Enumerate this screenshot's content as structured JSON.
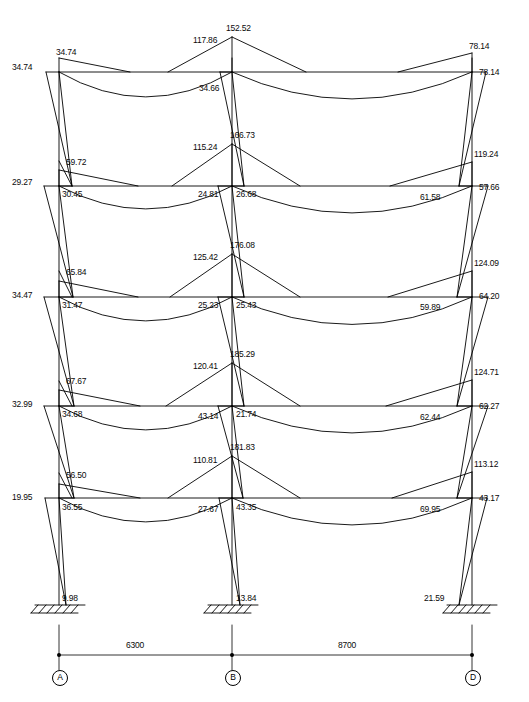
{
  "figure": {
    "type": "structural-bending-moment-diagram",
    "units_note": "kN·m",
    "ink_color": "#000000",
    "background_color": "#ffffff"
  },
  "geometry": {
    "columns": [
      {
        "id": "A",
        "x": 59
      },
      {
        "id": "B",
        "x": 232
      },
      {
        "id": "D",
        "x": 472
      }
    ],
    "floor_levels_y": [
      72,
      186,
      297,
      406,
      498
    ],
    "base_y": 605
  },
  "grid": {
    "labels": [
      "A",
      "B",
      "D"
    ],
    "x_positions": [
      59,
      232,
      472
    ]
  },
  "dimensions": {
    "line_y": 655,
    "spans": [
      {
        "label": "6300",
        "from": "A",
        "to": "B",
        "x": 126,
        "y": 641
      },
      {
        "label": "8700",
        "from": "B",
        "to": "D",
        "x": 338,
        "y": 641
      }
    ]
  },
  "supports": [
    {
      "at": "A",
      "label": "9.98",
      "x": 62,
      "y": 594
    },
    {
      "at": "B",
      "label": "13.84",
      "x": 236,
      "y": 594
    },
    {
      "at": "D",
      "label": "21.59",
      "x": 424,
      "y": 594
    }
  ],
  "storeys": [
    {
      "name": "storey-5-roof",
      "beam_y": 72,
      "labels": [
        {
          "value": "34.74",
          "x": 56,
          "y": 48,
          "anchor": "beam-left-top-A",
          "align": "left"
        },
        {
          "value": "34.74",
          "x": 12,
          "y": 63,
          "anchor": "column-top-A-left",
          "align": "left"
        },
        {
          "value": "117.86",
          "x": 193,
          "y": 36,
          "anchor": "beam-AB-right-end",
          "align": "left"
        },
        {
          "value": "152.52",
          "x": 226,
          "y": 24,
          "anchor": "column-top-B",
          "align": "left"
        },
        {
          "value": "34.66",
          "x": 199,
          "y": 84,
          "anchor": "column-B-top-below",
          "align": "left"
        },
        {
          "value": "78.14",
          "x": 469,
          "y": 42,
          "anchor": "beam-BD-right-end",
          "align": "left"
        },
        {
          "value": "78.14",
          "x": 479,
          "y": 68,
          "anchor": "column-top-D-right",
          "align": "left"
        }
      ]
    },
    {
      "name": "storey-4",
      "beam_y": 186,
      "labels": [
        {
          "value": "59.72",
          "x": 66,
          "y": 158,
          "anchor": "column-A-upper",
          "align": "left"
        },
        {
          "value": "29.27",
          "x": 12,
          "y": 178,
          "anchor": "joint-A-left",
          "align": "left"
        },
        {
          "value": "30.45",
          "x": 62,
          "y": 190,
          "anchor": "beam-AB-left-end",
          "align": "left"
        },
        {
          "value": "115.24",
          "x": 193,
          "y": 143,
          "anchor": "beam-AB-right-peak",
          "align": "left"
        },
        {
          "value": "166.73",
          "x": 230,
          "y": 131,
          "anchor": "joint-B",
          "align": "left"
        },
        {
          "value": "24.81",
          "x": 198,
          "y": 190,
          "anchor": "beam-AB-right-end",
          "align": "left"
        },
        {
          "value": "26.68",
          "x": 236,
          "y": 190,
          "anchor": "beam-BD-left-end",
          "align": "left"
        },
        {
          "value": "119.24",
          "x": 474,
          "y": 150,
          "anchor": "column-D-upper",
          "align": "left"
        },
        {
          "value": "61.58",
          "x": 420,
          "y": 193,
          "anchor": "beam-BD-right-end",
          "align": "left"
        },
        {
          "value": "57.66",
          "x": 479,
          "y": 183,
          "anchor": "joint-D-right",
          "align": "left"
        }
      ]
    },
    {
      "name": "storey-3",
      "beam_y": 297,
      "labels": [
        {
          "value": "65.84",
          "x": 66,
          "y": 268,
          "anchor": "column-A-upper",
          "align": "left"
        },
        {
          "value": "34.47",
          "x": 12,
          "y": 291,
          "anchor": "joint-A-left",
          "align": "left"
        },
        {
          "value": "31.47",
          "x": 62,
          "y": 301,
          "anchor": "beam-AB-left-end",
          "align": "left"
        },
        {
          "value": "125.42",
          "x": 193,
          "y": 253,
          "anchor": "beam-AB-right-peak",
          "align": "left"
        },
        {
          "value": "176.08",
          "x": 230,
          "y": 241,
          "anchor": "joint-B",
          "align": "left"
        },
        {
          "value": "25.23",
          "x": 198,
          "y": 301,
          "anchor": "beam-AB-right-end",
          "align": "left"
        },
        {
          "value": "25.43",
          "x": 236,
          "y": 301,
          "anchor": "beam-BD-left-end",
          "align": "left"
        },
        {
          "value": "124.09",
          "x": 474,
          "y": 259,
          "anchor": "column-D-upper",
          "align": "left"
        },
        {
          "value": "59.89",
          "x": 420,
          "y": 303,
          "anchor": "beam-BD-right-end",
          "align": "left"
        },
        {
          "value": "64.20",
          "x": 479,
          "y": 292,
          "anchor": "joint-D-right",
          "align": "left"
        }
      ]
    },
    {
      "name": "storey-2",
      "beam_y": 406,
      "labels": [
        {
          "value": "67.67",
          "x": 66,
          "y": 377,
          "anchor": "column-A-upper",
          "align": "left"
        },
        {
          "value": "32.99",
          "x": 12,
          "y": 400,
          "anchor": "joint-A-left",
          "align": "left"
        },
        {
          "value": "34.68",
          "x": 62,
          "y": 410,
          "anchor": "beam-AB-left-end",
          "align": "left"
        },
        {
          "value": "120.41",
          "x": 193,
          "y": 362,
          "anchor": "beam-AB-right-peak",
          "align": "left"
        },
        {
          "value": "185.29",
          "x": 230,
          "y": 350,
          "anchor": "joint-B",
          "align": "left"
        },
        {
          "value": "43.14",
          "x": 198,
          "y": 412,
          "anchor": "beam-AB-right-end",
          "align": "left"
        },
        {
          "value": "21.74",
          "x": 236,
          "y": 410,
          "anchor": "beam-BD-left-end",
          "align": "left"
        },
        {
          "value": "124.71",
          "x": 474,
          "y": 368,
          "anchor": "column-D-upper",
          "align": "left"
        },
        {
          "value": "62.44",
          "x": 420,
          "y": 413,
          "anchor": "beam-BD-right-end",
          "align": "left"
        },
        {
          "value": "62.27",
          "x": 479,
          "y": 402,
          "anchor": "joint-D-right",
          "align": "left"
        }
      ]
    },
    {
      "name": "storey-1",
      "beam_y": 498,
      "labels": [
        {
          "value": "56.50",
          "x": 66,
          "y": 471,
          "anchor": "column-A-upper",
          "align": "left"
        },
        {
          "value": "19.95",
          "x": 12,
          "y": 493,
          "anchor": "joint-A-left",
          "align": "left"
        },
        {
          "value": "36.55",
          "x": 62,
          "y": 503,
          "anchor": "beam-AB-left-end",
          "align": "left"
        },
        {
          "value": "110.81",
          "x": 193,
          "y": 456,
          "anchor": "beam-AB-right-peak",
          "align": "left"
        },
        {
          "value": "181.83",
          "x": 230,
          "y": 443,
          "anchor": "joint-B",
          "align": "left"
        },
        {
          "value": "27.67",
          "x": 198,
          "y": 505,
          "anchor": "beam-AB-right-end",
          "align": "left"
        },
        {
          "value": "43.35",
          "x": 236,
          "y": 503,
          "anchor": "beam-BD-left-end",
          "align": "left"
        },
        {
          "value": "113.12",
          "x": 474,
          "y": 460,
          "anchor": "column-D-upper",
          "align": "left"
        },
        {
          "value": "69.95",
          "x": 420,
          "y": 505,
          "anchor": "beam-BD-right-end",
          "align": "left"
        },
        {
          "value": "43.17",
          "x": 479,
          "y": 494,
          "anchor": "joint-D-right",
          "align": "left"
        }
      ]
    }
  ],
  "chart_data": {
    "type": "line",
    "xlabel": "",
    "ylabel": "",
    "all_moment_values": [
      34.74,
      34.74,
      117.86,
      152.52,
      34.66,
      78.14,
      78.14,
      59.72,
      29.27,
      30.45,
      115.24,
      166.73,
      24.81,
      26.68,
      119.24,
      61.58,
      57.66,
      65.84,
      34.47,
      31.47,
      125.42,
      176.08,
      25.23,
      25.43,
      124.09,
      59.89,
      64.2,
      67.67,
      32.99,
      34.68,
      120.41,
      185.29,
      43.14,
      21.74,
      124.71,
      62.44,
      62.27,
      56.5,
      19.95,
      36.55,
      110.81,
      181.83,
      27.67,
      43.35,
      113.12,
      69.95,
      43.17,
      9.98,
      13.84,
      21.59
    ],
    "span_lengths": [
      6300,
      8700
    ],
    "grid_labels": [
      "A",
      "B",
      "D"
    ]
  }
}
